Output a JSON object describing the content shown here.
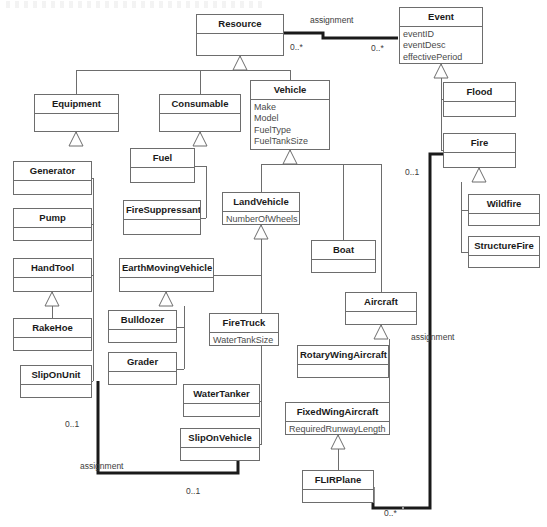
{
  "diagram": {
    "type": "uml-class-diagram",
    "stroke_color": "#6d6d6d",
    "thick_edge_color": "#1a1a1a",
    "attribute_color": "#4a4a4a",
    "background": "#ffffff"
  },
  "classes": [
    {
      "id": "resource",
      "name": "Resource",
      "attributes": [],
      "x": 196,
      "y": 14,
      "w": 88,
      "h": 42
    },
    {
      "id": "event",
      "name": "Event",
      "attributes": [
        "eventID",
        "eventDesc",
        "effectivePeriod"
      ],
      "x": 399,
      "y": 7,
      "w": 84,
      "h": 57
    },
    {
      "id": "equipment",
      "name": "Equipment",
      "attributes": [],
      "x": 34,
      "y": 94,
      "w": 85,
      "h": 38
    },
    {
      "id": "consumable",
      "name": "Consumable",
      "attributes": [],
      "x": 159,
      "y": 94,
      "w": 82,
      "h": 38
    },
    {
      "id": "vehicle",
      "name": "Vehicle",
      "attributes": [
        "Make",
        "Model",
        "FuelType",
        "FuelTankSize"
      ],
      "x": 250,
      "y": 80,
      "w": 80,
      "h": 70
    },
    {
      "id": "flood",
      "name": "Flood",
      "attributes": [],
      "x": 443,
      "y": 82,
      "w": 73,
      "h": 35
    },
    {
      "id": "fire",
      "name": "Fire",
      "attributes": [],
      "x": 443,
      "y": 133,
      "w": 73,
      "h": 35
    },
    {
      "id": "generator",
      "name": "Generator",
      "attributes": [],
      "x": 13,
      "y": 161,
      "w": 79,
      "h": 34
    },
    {
      "id": "fuel",
      "name": "Fuel",
      "attributes": [],
      "x": 130,
      "y": 148,
      "w": 65,
      "h": 35
    },
    {
      "id": "pump",
      "name": "Pump",
      "attributes": [],
      "x": 13,
      "y": 208,
      "w": 79,
      "h": 33
    },
    {
      "id": "firesuppressant",
      "name": "FireSuppressant",
      "attributes": [],
      "x": 123,
      "y": 200,
      "w": 78,
      "h": 35
    },
    {
      "id": "landvehicle",
      "name": "LandVehicle",
      "attributes": [
        "NumberOfWheels"
      ],
      "x": 222,
      "y": 192,
      "w": 78,
      "h": 33
    },
    {
      "id": "wildfire",
      "name": "Wildfire",
      "attributes": [],
      "x": 468,
      "y": 194,
      "w": 72,
      "h": 32
    },
    {
      "id": "structurefire",
      "name": "StructureFire",
      "attributes": [],
      "x": 468,
      "y": 236,
      "w": 72,
      "h": 32
    },
    {
      "id": "boat",
      "name": "Boat",
      "attributes": [],
      "x": 311,
      "y": 240,
      "w": 65,
      "h": 33
    },
    {
      "id": "handtool",
      "name": "HandTool",
      "attributes": [],
      "x": 13,
      "y": 258,
      "w": 79,
      "h": 34
    },
    {
      "id": "earthmovingvehicle",
      "name": "EarthMovingVehicle",
      "attributes": [],
      "x": 119,
      "y": 258,
      "w": 95,
      "h": 34
    },
    {
      "id": "aircraft",
      "name": "Aircraft",
      "attributes": [],
      "x": 345,
      "y": 292,
      "w": 72,
      "h": 33
    },
    {
      "id": "rakehoe",
      "name": "RakeHoe",
      "attributes": [],
      "x": 13,
      "y": 318,
      "w": 79,
      "h": 33
    },
    {
      "id": "bulldozer",
      "name": "Bulldozer",
      "attributes": [],
      "x": 108,
      "y": 310,
      "w": 69,
      "h": 33
    },
    {
      "id": "firetruck",
      "name": "FireTruck",
      "attributes": [
        "WaterTankSize"
      ],
      "x": 209,
      "y": 313,
      "w": 70,
      "h": 33
    },
    {
      "id": "rotarywingaircraft",
      "name": "RotaryWingAircraft",
      "attributes": [],
      "x": 297,
      "y": 345,
      "w": 92,
      "h": 33
    },
    {
      "id": "slipOnUnit",
      "name": "SlipOnUnit",
      "attributes": [],
      "x": 20,
      "y": 365,
      "w": 72,
      "h": 33
    },
    {
      "id": "grader",
      "name": "Grader",
      "attributes": [],
      "x": 108,
      "y": 352,
      "w": 69,
      "h": 33
    },
    {
      "id": "watertanker",
      "name": "WaterTanker",
      "attributes": [],
      "x": 183,
      "y": 384,
      "w": 77,
      "h": 33
    },
    {
      "id": "fixedwingaircraft",
      "name": "FixedWingAircraft",
      "attributes": [
        "RequiredRunwayLength"
      ],
      "x": 285,
      "y": 402,
      "w": 105,
      "h": 33
    },
    {
      "id": "sliponvehicle",
      "name": "SlipOnVehicle",
      "attributes": [],
      "x": 180,
      "y": 428,
      "w": 80,
      "h": 33
    },
    {
      "id": "flirplane",
      "name": "FLIRPlane",
      "attributes": [],
      "x": 302,
      "y": 470,
      "w": 72,
      "h": 33
    }
  ],
  "edge_labels": [
    {
      "id": "assignment-top",
      "text": "assignment",
      "x": 310,
      "y": 16
    },
    {
      "id": "mult-resource",
      "text": "0..*",
      "x": 290,
      "y": 43
    },
    {
      "id": "mult-event-left",
      "text": "0..*",
      "x": 371,
      "y": 44
    },
    {
      "id": "mult-fire-01",
      "text": "0..1",
      "x": 405,
      "y": 168
    },
    {
      "id": "assignment-aircraft",
      "text": "assignment",
      "x": 411,
      "y": 333
    },
    {
      "id": "mult-sliponunit-01",
      "text": "0..1",
      "x": 65,
      "y": 420
    },
    {
      "id": "assignment-bottom",
      "text": "assignment",
      "x": 80,
      "y": 462
    },
    {
      "id": "mult-sliponveh-01",
      "text": "0..1",
      "x": 186,
      "y": 487
    },
    {
      "id": "mult-flirplane",
      "text": "0..*",
      "x": 384,
      "y": 509
    }
  ],
  "generalizations": [
    {
      "parent": "resource",
      "children": [
        "equipment",
        "consumable",
        "vehicle"
      ]
    },
    {
      "parent": "event",
      "children": [
        "flood",
        "fire"
      ]
    },
    {
      "parent": "equipment",
      "children": [
        "generator",
        "pump",
        "handtool",
        "slipOnUnit"
      ]
    },
    {
      "parent": "consumable",
      "children": [
        "fuel",
        "firesuppressant"
      ]
    },
    {
      "parent": "vehicle",
      "children": [
        "landvehicle",
        "boat",
        "aircraft"
      ]
    },
    {
      "parent": "fire",
      "children": [
        "wildfire",
        "structurefire"
      ]
    },
    {
      "parent": "handtool",
      "children": [
        "rakehoe"
      ]
    },
    {
      "parent": "landvehicle",
      "children": [
        "earthmovingvehicle",
        "firetruck",
        "watertanker",
        "sliponvehicle"
      ]
    },
    {
      "parent": "earthmovingvehicle",
      "children": [
        "bulldozer",
        "grader"
      ]
    },
    {
      "parent": "aircraft",
      "children": [
        "rotarywingaircraft",
        "fixedwingaircraft"
      ]
    },
    {
      "parent": "fixedwingaircraft",
      "children": [
        "flirplane"
      ]
    }
  ],
  "associations": [
    {
      "id": "resource-event",
      "name": "assignment",
      "from": "resource",
      "to": "event",
      "from_mult": "0..*",
      "to_mult": "0..*"
    },
    {
      "id": "sliponunit-sliponveh",
      "name": "assignment",
      "from": "slipOnUnit",
      "to": "sliponvehicle",
      "from_mult": "0..1",
      "to_mult": "0..1"
    },
    {
      "id": "fire-flirplane",
      "name": "assignment",
      "from": "fire",
      "to": "flirplane",
      "from_mult": "0..1",
      "to_mult": "0..*"
    }
  ]
}
